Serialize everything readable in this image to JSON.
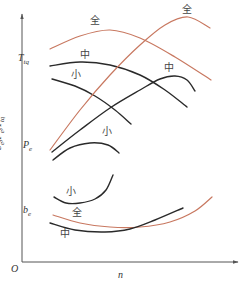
{
  "chart_data": {
    "type": "line",
    "title": "",
    "xlabel": "n",
    "ylabel": "be, Pe, Ttq",
    "origin_label": "O",
    "grid": false,
    "legend": "inline labels",
    "axes_ticks": "none (qualitative)",
    "colors": {
      "full_load": "#c87860",
      "partial_load": "#2a2a2a",
      "axis": "#555555"
    },
    "load_labels": {
      "full": "全",
      "medium": "中",
      "small": "小"
    },
    "series": [
      {
        "name": "Ttq 全",
        "group": "Ttq",
        "load": "全",
        "color": "#c87860",
        "points": [
          [
            50,
            49
          ],
          [
            80,
            36
          ],
          [
            110,
            30
          ],
          [
            140,
            38
          ],
          [
            175,
            57
          ],
          [
            211,
            80
          ]
        ]
      },
      {
        "name": "Ttq 中",
        "group": "Ttq",
        "load": "中",
        "color": "#2a2a2a",
        "points": [
          [
            50,
            66
          ],
          [
            80,
            62
          ],
          [
            110,
            65
          ],
          [
            140,
            75
          ],
          [
            165,
            90
          ],
          [
            187,
            107
          ]
        ]
      },
      {
        "name": "Ttq 小",
        "group": "Ttq",
        "load": "小",
        "color": "#2a2a2a",
        "points": [
          [
            52,
            79
          ],
          [
            75,
            86
          ],
          [
            95,
            96
          ],
          [
            115,
            110
          ],
          [
            131,
            124
          ]
        ]
      },
      {
        "name": "Pe 全",
        "group": "Pe",
        "load": "全",
        "color": "#c87860",
        "points": [
          [
            50,
            150
          ],
          [
            80,
            110
          ],
          [
            110,
            75
          ],
          [
            140,
            45
          ],
          [
            165,
            25
          ],
          [
            188,
            17
          ],
          [
            210,
            28
          ]
        ]
      },
      {
        "name": "Pe 中",
        "group": "Pe",
        "load": "中",
        "color": "#2a2a2a",
        "points": [
          [
            52,
            152
          ],
          [
            80,
            130
          ],
          [
            110,
            108
          ],
          [
            140,
            90
          ],
          [
            160,
            79
          ],
          [
            175,
            76
          ],
          [
            187,
            80
          ],
          [
            195,
            91
          ]
        ]
      },
      {
        "name": "Pe 小",
        "group": "Pe",
        "load": "小",
        "color": "#2a2a2a",
        "points": [
          [
            53,
            160
          ],
          [
            70,
            148
          ],
          [
            90,
            143
          ],
          [
            108,
            145
          ],
          [
            119,
            153
          ]
        ]
      },
      {
        "name": "be 小",
        "group": "be",
        "load": "小",
        "color": "#2a2a2a",
        "points": [
          [
            54,
            197
          ],
          [
            66,
            203
          ],
          [
            80,
            203
          ],
          [
            95,
            199
          ],
          [
            106,
            190
          ],
          [
            113,
            175
          ]
        ]
      },
      {
        "name": "be 全",
        "group": "be",
        "load": "全",
        "color": "#c87860",
        "points": [
          [
            53,
            215
          ],
          [
            80,
            223
          ],
          [
            110,
            227
          ],
          [
            140,
            227
          ],
          [
            170,
            222
          ],
          [
            195,
            211
          ],
          [
            212,
            197
          ]
        ]
      },
      {
        "name": "be 中",
        "group": "be",
        "load": "中",
        "color": "#2a2a2a",
        "points": [
          [
            50,
            223
          ],
          [
            75,
            230
          ],
          [
            105,
            232
          ],
          [
            130,
            229
          ],
          [
            155,
            220
          ],
          [
            183,
            208
          ]
        ]
      }
    ],
    "curve_labels": [
      {
        "text": "全",
        "x": 90,
        "y": 16
      },
      {
        "text": "全",
        "x": 182,
        "y": 5
      },
      {
        "text": "中",
        "x": 80,
        "y": 50
      },
      {
        "text": "中",
        "x": 164,
        "y": 63
      },
      {
        "text": "小",
        "x": 71,
        "y": 70
      },
      {
        "text": "小",
        "x": 102,
        "y": 127
      },
      {
        "text": "小",
        "x": 66,
        "y": 187
      },
      {
        "text": "全",
        "x": 72,
        "y": 208
      },
      {
        "text": "中",
        "x": 60,
        "y": 229
      }
    ],
    "series_name_labels": [
      {
        "text": "T",
        "sub": "tq",
        "x": 32,
        "y": 59
      },
      {
        "text": "P",
        "sub": "e",
        "x": 37,
        "y": 146
      },
      {
        "text": "b",
        "sub": "e",
        "x": 37,
        "y": 211
      }
    ]
  },
  "labels": {
    "origin": "O",
    "x_axis": "n",
    "y_axis": "be, Pe, Ttq"
  }
}
